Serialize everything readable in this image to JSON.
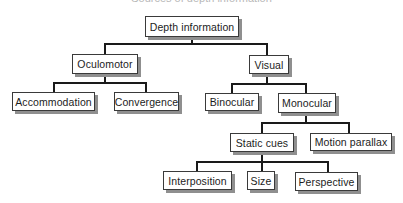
{
  "title": "Sources of depth information",
  "nodes": {
    "root": "Depth information",
    "oculomotor": "Oculomotor",
    "visual": "Visual",
    "accommodation": "Accommodation",
    "convergence": "Convergence",
    "binocular": "Binocular",
    "monocular": "Monocular",
    "static_cues": "Static cues",
    "motion_parallax": "Motion parallax",
    "interposition": "Interposition",
    "size": "Size",
    "perspective": "Perspective"
  },
  "colors": {
    "line": "#1a1a1a",
    "box_border": "#3a3a3a",
    "box_shadow": "#8f8f8f",
    "background": "#ffffff"
  }
}
